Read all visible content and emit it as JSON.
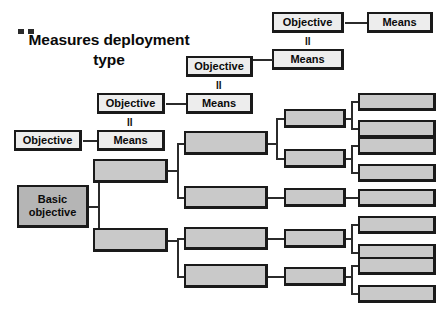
{
  "title": "Measures deployment\ntype",
  "labels": {
    "objective": "Objective",
    "means": "Means",
    "basic_objective": "Basic\nobjective",
    "equals": "II"
  },
  "colors": {
    "light_fill": "#ededed",
    "shade_fill": "#b5b5b5",
    "mid_fill": "#c9c9c9",
    "border": "#1a1a1a",
    "connector": "#2b2b2b",
    "background": "#ffffff",
    "text": "#0a0a0a"
  },
  "diagram": {
    "type": "tree",
    "orientation": "left-to-right",
    "levels": [
      {
        "index": 0,
        "name": "basic-objective",
        "node_count": 1
      },
      {
        "index": 1,
        "name": "level-1-measures",
        "node_count": 2
      },
      {
        "index": 2,
        "name": "level-2-measures",
        "node_count": 4
      },
      {
        "index": 3,
        "name": "level-3-measures",
        "node_count": 5
      },
      {
        "index": 4,
        "name": "level-4-measures",
        "node_count": 10
      }
    ],
    "legend_chain": [
      {
        "step": 1,
        "objective": "Objective",
        "relation": "II",
        "means": "Means"
      },
      {
        "step": 2,
        "objective": "Objective",
        "relation": "II",
        "means": "Means"
      },
      {
        "step": 3,
        "objective": "Objective",
        "relation": "",
        "means": "Means"
      }
    ]
  },
  "nodes": {
    "basic_objective": {
      "label": "Basic\nobjective"
    },
    "chain": {
      "l1_objective": "Objective",
      "l1_means": "Means",
      "l2_objective": "Objective",
      "l2_means": "Means",
      "l3_objective": "Objective",
      "l3_means": "Means"
    },
    "blank_boxes": [
      {
        "id": "c1-a",
        "label": ""
      },
      {
        "id": "c1-b",
        "label": ""
      },
      {
        "id": "c2-a",
        "label": ""
      },
      {
        "id": "c2-b",
        "label": ""
      },
      {
        "id": "c2-c",
        "label": ""
      },
      {
        "id": "c2-d",
        "label": ""
      },
      {
        "id": "c3-a",
        "label": ""
      },
      {
        "id": "c3-b",
        "label": ""
      },
      {
        "id": "c3-c",
        "label": ""
      },
      {
        "id": "c3-d",
        "label": ""
      },
      {
        "id": "c3-e",
        "label": ""
      },
      {
        "id": "c4-a",
        "label": ""
      },
      {
        "id": "c4-b",
        "label": ""
      },
      {
        "id": "c4-c",
        "label": ""
      },
      {
        "id": "c4-d",
        "label": ""
      },
      {
        "id": "c4-e",
        "label": ""
      },
      {
        "id": "c4-f",
        "label": ""
      },
      {
        "id": "c4-g",
        "label": ""
      },
      {
        "id": "c4-h",
        "label": ""
      },
      {
        "id": "c4-i",
        "label": ""
      },
      {
        "id": "c4-j",
        "label": ""
      }
    ]
  }
}
